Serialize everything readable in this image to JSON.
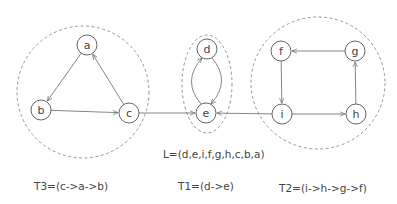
{
  "diagram": {
    "clusters": [
      {
        "id": "T3",
        "shape": "circle",
        "cx": 83,
        "cy": 92,
        "rx": 66,
        "ry": 66
      },
      {
        "id": "T1",
        "shape": "ellipse",
        "cx": 207,
        "cy": 84,
        "rx": 25,
        "ry": 49
      },
      {
        "id": "T2",
        "shape": "circle",
        "cx": 318,
        "cy": 83,
        "rx": 67,
        "ry": 66
      }
    ],
    "nodes": [
      {
        "id": "a",
        "label": "a",
        "x": 87,
        "y": 45
      },
      {
        "id": "b",
        "label": "b",
        "x": 41,
        "y": 110
      },
      {
        "id": "c",
        "label": "c",
        "x": 129,
        "y": 113
      },
      {
        "id": "d",
        "label": "d",
        "x": 207,
        "y": 49
      },
      {
        "id": "e",
        "label": "e",
        "x": 206,
        "y": 113
      },
      {
        "id": "f",
        "label": "f",
        "x": 281,
        "y": 51
      },
      {
        "id": "g",
        "label": "g",
        "x": 355,
        "y": 51
      },
      {
        "id": "i",
        "label": "i",
        "x": 282,
        "y": 114
      },
      {
        "id": "h",
        "label": "h",
        "x": 356,
        "y": 114
      }
    ],
    "edges": [
      {
        "from": "a",
        "to": "b"
      },
      {
        "from": "b",
        "to": "c"
      },
      {
        "from": "c",
        "to": "a"
      },
      {
        "from": "c",
        "to": "e"
      },
      {
        "from": "d",
        "to": "e",
        "curve": "right"
      },
      {
        "from": "e",
        "to": "d",
        "curve": "left"
      },
      {
        "from": "i",
        "to": "e"
      },
      {
        "from": "f",
        "to": "i"
      },
      {
        "from": "i",
        "to": "h"
      },
      {
        "from": "h",
        "to": "g"
      },
      {
        "from": "g",
        "to": "f"
      }
    ],
    "node_radius": 10
  },
  "captions": {
    "order_list": "L=(d,e,i,f,g,h,c,b,a)",
    "t3": "T3=(c->a->b)",
    "t1": "T1=(d->e)",
    "t2": "T2=(i->h->g->f)"
  }
}
